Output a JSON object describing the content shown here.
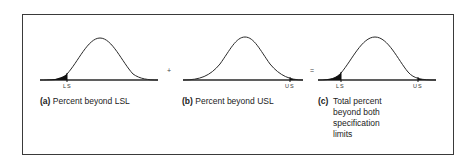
{
  "panels": [
    {
      "id": "a",
      "caption_tag": "(a)",
      "caption_text": "Percent beyond LSL",
      "limits": [
        "LS"
      ],
      "shaded_tails": [
        "left"
      ]
    },
    {
      "id": "b",
      "caption_tag": "(b)",
      "caption_text": "Percent beyond USL",
      "limits": [
        "US"
      ],
      "shaded_tails": [
        "right"
      ]
    },
    {
      "id": "c",
      "caption_tag": "(c)",
      "caption_lines": [
        "Total percent",
        "beyond both",
        "specification",
        "limits"
      ],
      "limits": [
        "LS",
        "US"
      ],
      "shaded_tails": [
        "left",
        "right"
      ]
    }
  ],
  "operators": {
    "plus": "+",
    "equals": "="
  },
  "colors": {
    "frame": "#3a3a3a",
    "curve": "#2a2a2a",
    "shade": "#111111"
  }
}
